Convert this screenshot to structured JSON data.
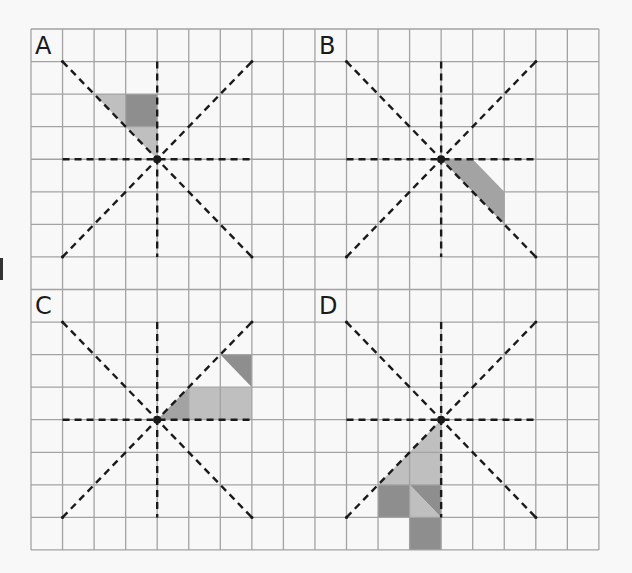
{
  "figure": {
    "grid": {
      "columns": 18,
      "rows": 16,
      "origin_px": [
        31,
        29
      ],
      "cell_px": [
        31.55,
        32.56
      ]
    },
    "colors": {
      "background": "#f8f8f8",
      "grid_line": "#a3a3a3",
      "dash_line": "#1a1a1a",
      "shade_light": "#bfbfbf",
      "shade_mid": "#a3a3a3",
      "shade_dark": "#8e8e8e"
    },
    "panels": [
      {
        "label": "A",
        "label_cell": [
          0,
          0
        ],
        "center": [
          4,
          4
        ],
        "shapes": [
          {
            "tone": "light",
            "points": [
              [
                2,
                2
              ],
              [
                3,
                2
              ],
              [
                3,
                3
              ]
            ]
          },
          {
            "tone": "dark",
            "points": [
              [
                3,
                2
              ],
              [
                4,
                2
              ],
              [
                4,
                3
              ],
              [
                3,
                3
              ]
            ]
          },
          {
            "tone": "light",
            "points": [
              [
                3,
                3
              ],
              [
                4,
                3
              ],
              [
                4,
                4
              ]
            ]
          }
        ]
      },
      {
        "label": "B",
        "label_cell": [
          9,
          0
        ],
        "center": [
          13,
          4
        ],
        "shapes": [
          {
            "tone": "mid",
            "points": [
              [
                13,
                4
              ],
              [
                14,
                4
              ],
              [
                15,
                5
              ],
              [
                15,
                6
              ]
            ]
          }
        ]
      },
      {
        "label": "C",
        "label_cell": [
          0,
          8
        ],
        "center": [
          4,
          12
        ],
        "shapes": [
          {
            "tone": "dark",
            "points": [
              [
                6,
                10
              ],
              [
                7,
                10
              ],
              [
                7,
                11
              ]
            ]
          },
          {
            "tone": "mid",
            "points": [
              [
                4,
                12
              ],
              [
                5,
                11
              ],
              [
                5,
                12
              ]
            ]
          },
          {
            "tone": "light",
            "points": [
              [
                5,
                11
              ],
              [
                7,
                11
              ],
              [
                7,
                12
              ],
              [
                5,
                12
              ]
            ]
          }
        ]
      },
      {
        "label": "D",
        "label_cell": [
          9,
          8
        ],
        "center": [
          13,
          12
        ],
        "shapes": [
          {
            "tone": "light",
            "points": [
              [
                13,
                12
              ],
              [
                11,
                14
              ],
              [
                13,
                14
              ]
            ]
          },
          {
            "tone": "dark",
            "points": [
              [
                11,
                14
              ],
              [
                12,
                14
              ],
              [
                12,
                15
              ],
              [
                11,
                15
              ]
            ]
          },
          {
            "tone": "dark",
            "points": [
              [
                12,
                14
              ],
              [
                13,
                14
              ],
              [
                13,
                15
              ]
            ]
          },
          {
            "tone": "light",
            "points": [
              [
                12,
                14
              ],
              [
                12,
                15
              ],
              [
                13,
                15
              ]
            ]
          },
          {
            "tone": "dark",
            "points": [
              [
                12,
                15
              ],
              [
                13,
                15
              ],
              [
                13,
                16
              ],
              [
                12,
                16
              ]
            ]
          }
        ]
      }
    ],
    "axis_half_length_cells": 3
  }
}
